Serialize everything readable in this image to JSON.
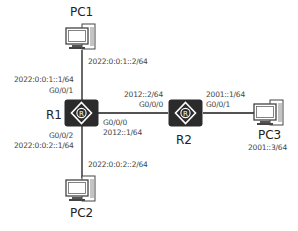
{
  "diagram": {
    "nodes": {
      "pc1": {
        "label": "PC1",
        "icon": "pc-icon",
        "ip": "2022:0:0:1::2/64"
      },
      "pc2": {
        "label": "PC2",
        "icon": "pc-icon",
        "ip": "2022:0:0:2::2/64"
      },
      "pc3": {
        "label": "PC3",
        "icon": "pc-icon",
        "ip": "2001::3/64"
      },
      "r1": {
        "label": "R1",
        "icon": "router-icon",
        "g001": {
          "port": "G0/0/1",
          "ip": "2022:0:0:1::1/64"
        },
        "g002": {
          "port": "G0/0/2",
          "ip": "2022:0:0:2::1/64"
        },
        "g000": {
          "port": "G0/0/0",
          "ip": "2012::1/64"
        }
      },
      "r2": {
        "label": "R2",
        "icon": "router-icon",
        "g000": {
          "port": "G0/0/0",
          "ip": "2012::2/64"
        },
        "g001": {
          "port": "G0/0/1",
          "ip": "2001::1/64"
        }
      }
    },
    "links": [
      {
        "from": "PC1",
        "to": "R1 G0/0/1"
      },
      {
        "from": "PC2",
        "to": "R1 G0/0/2"
      },
      {
        "from": "R1 G0/0/0",
        "to": "R2 G0/0/0"
      },
      {
        "from": "R2 G0/0/1",
        "to": "PC3"
      }
    ],
    "colors": {
      "device": "#2b2b2b",
      "link": "#1a1a1a",
      "text": "#444444"
    }
  }
}
